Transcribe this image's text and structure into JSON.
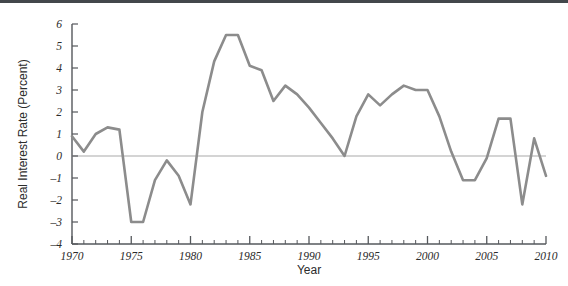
{
  "figure": {
    "background_color": "#ffffff",
    "top_band_color": "#43474b"
  },
  "chart_data": {
    "type": "line",
    "title": "",
    "subtitle": "",
    "xlabel": "Year",
    "ylabel": "Real Interest Rate (Percent)",
    "xlim": [
      1970,
      2010
    ],
    "ylim": [
      -4,
      6
    ],
    "grid": false,
    "legend": "none",
    "zero_line": true,
    "line_color": "#8c8c8c",
    "axis_color": "#55585c",
    "zero_line_color": "#a9a9a9",
    "x_major_ticks": [
      1970,
      1975,
      1980,
      1985,
      1990,
      1995,
      2000,
      2005,
      2010
    ],
    "x_major_tick_labels": [
      "1970",
      "1975",
      "1980",
      "1985",
      "1990",
      "1995",
      "2000",
      "2005",
      "2010"
    ],
    "x_minor_tick_step": 1,
    "y_ticks": [
      -4,
      -3,
      -2,
      -1,
      0,
      1,
      2,
      3,
      4,
      5,
      6
    ],
    "y_tick_labels": [
      "-4",
      "-3",
      "-2",
      "-1",
      "0",
      "1",
      "2",
      "3",
      "4",
      "5",
      "6"
    ],
    "series": [
      {
        "name": "Real Interest Rate",
        "x": [
          1970,
          1971,
          1972,
          1973,
          1974,
          1975,
          1976,
          1977,
          1978,
          1979,
          1980,
          1981,
          1982,
          1983,
          1984,
          1985,
          1986,
          1987,
          1988,
          1989,
          1990,
          1991,
          1992,
          1993,
          1994,
          1995,
          1996,
          1997,
          1998,
          1999,
          2000,
          2001,
          2002,
          2003,
          2004,
          2005,
          2006,
          2007,
          2008,
          2009,
          2010
        ],
        "values": [
          0.9,
          0.2,
          1.0,
          1.3,
          1.2,
          -3.0,
          -3.0,
          -1.1,
          -0.2,
          -0.9,
          -2.2,
          2.0,
          4.3,
          5.5,
          5.5,
          4.1,
          3.9,
          2.5,
          3.2,
          2.8,
          2.2,
          1.5,
          0.8,
          0.0,
          1.8,
          2.8,
          2.3,
          2.8,
          3.2,
          3.0,
          3.0,
          1.8,
          0.2,
          -1.1,
          -1.1,
          -0.1,
          1.7,
          1.7,
          -2.2,
          0.8,
          -0.9
        ]
      }
    ]
  }
}
